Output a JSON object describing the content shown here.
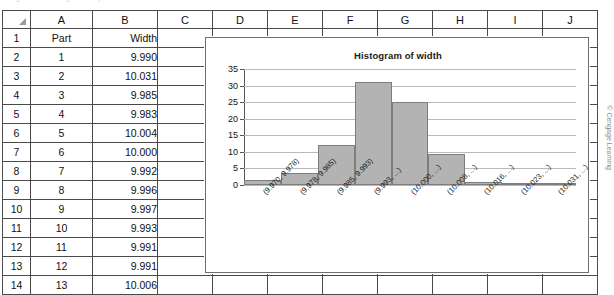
{
  "top_caption": "Figure — histogram of part widths",
  "spreadsheet": {
    "column_headers": [
      "A",
      "B",
      "C",
      "D",
      "E",
      "F",
      "G",
      "H",
      "I",
      "J"
    ],
    "corner_icon": "select-all-triangle-icon",
    "row_numbers": [
      "1",
      "2",
      "3",
      "4",
      "5",
      "6",
      "7",
      "8",
      "9",
      "10",
      "11",
      "12",
      "13",
      "14"
    ],
    "header_row": {
      "a": "Part",
      "b": "Width"
    },
    "rows": [
      {
        "row": "2",
        "a": "1",
        "b": "9.990"
      },
      {
        "row": "3",
        "a": "2",
        "b": "10.031"
      },
      {
        "row": "4",
        "a": "3",
        "b": "9.985"
      },
      {
        "row": "5",
        "a": "4",
        "b": "9.983"
      },
      {
        "row": "6",
        "a": "5",
        "b": "10.004"
      },
      {
        "row": "7",
        "a": "6",
        "b": "10.000"
      },
      {
        "row": "8",
        "a": "7",
        "b": "9.992"
      },
      {
        "row": "9",
        "a": "8",
        "b": "9.996"
      },
      {
        "row": "10",
        "a": "9",
        "b": "9.997"
      },
      {
        "row": "11",
        "a": "10",
        "b": "9.993"
      },
      {
        "row": "12",
        "a": "11",
        "b": "9.991"
      },
      {
        "row": "13",
        "a": "12",
        "b": "9.991"
      },
      {
        "row": "14",
        "a": "13",
        "b": "10.006"
      }
    ]
  },
  "chart_data": {
    "type": "bar",
    "title": "Histogram of width",
    "xlabel": "",
    "ylabel": "",
    "ylim": [
      0,
      35
    ],
    "yticks": [
      0,
      5,
      10,
      15,
      20,
      25,
      30,
      35
    ],
    "grid": true,
    "legend": false,
    "bar_color": "#b3b3b3",
    "bar_border_color": "#7d7d7d",
    "categories": [
      "(9.970, 9.978)",
      "(9.978, 9.985)",
      "(9.985, 9.993)",
      "(9.993, ...)",
      "(10.000, ...)",
      "(10.008, ...)",
      "(10.016, ...)",
      "(10.023, ...)",
      "(10.031, ...)"
    ],
    "values": [
      1.5,
      3.5,
      12,
      31,
      25,
      9.5,
      1,
      0,
      0.3
    ]
  },
  "copyright": "© Cengage Learning"
}
